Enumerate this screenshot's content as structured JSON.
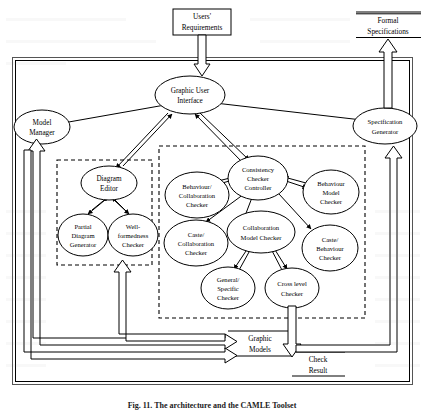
{
  "figure": {
    "caption": "Fig. 11. The architecture and the CAMLE Toolset",
    "title": "The architecture and the CAMLE Toolset"
  },
  "external": {
    "input_box": {
      "name": "users-requirements",
      "lines": [
        "Users'",
        "Requirements"
      ]
    },
    "output_box": {
      "name": "formal-specifications",
      "lines": [
        "Formal",
        "Specifications"
      ]
    }
  },
  "nodes": [
    {
      "id": "gui",
      "lines": [
        "Graphic User",
        "Interface"
      ]
    },
    {
      "id": "model_manager",
      "lines": [
        "Model",
        "Manager"
      ]
    },
    {
      "id": "specification_generator",
      "lines": [
        "Specification",
        "Generator"
      ]
    },
    {
      "id": "diagram_editor",
      "lines": [
        "Diagram",
        "Editor"
      ]
    },
    {
      "id": "partial_diagram_generator",
      "lines": [
        "Partial",
        "Diagram",
        "Generator"
      ]
    },
    {
      "id": "well_formedness_checker",
      "lines": [
        "Well-",
        "formedness",
        "Checker"
      ]
    },
    {
      "id": "behaviour_collaboration_checker",
      "lines": [
        "Behaviour/",
        "Collaboration",
        "Checker"
      ]
    },
    {
      "id": "consistency_checker_controller",
      "lines": [
        "Consistency",
        "Checker",
        "Controller"
      ]
    },
    {
      "id": "behaviour_model_checker",
      "lines": [
        "Behaviour",
        "Model",
        "Checker"
      ]
    },
    {
      "id": "caste_collaboration_checker",
      "lines": [
        "Caste/",
        "Collaboration",
        "Checker"
      ]
    },
    {
      "id": "collaboration_model_checker",
      "lines": [
        "Collaboration",
        "Model Checker"
      ]
    },
    {
      "id": "caste_behaviour_checker",
      "lines": [
        "Caste/",
        "Behaviour",
        "Checker"
      ]
    },
    {
      "id": "general_specific_checker",
      "lines": [
        "General/",
        "Specific",
        "Checker"
      ]
    },
    {
      "id": "cross_level_checker",
      "lines": [
        "Cross level",
        "Checker"
      ]
    }
  ],
  "data_stores": [
    {
      "id": "graphic_models",
      "lines": [
        "Graphic",
        "Models"
      ]
    },
    {
      "id": "check_result",
      "lines": [
        "Check",
        "Result"
      ]
    }
  ],
  "groups": [
    {
      "id": "editor-group",
      "label": ""
    },
    {
      "id": "checker-group",
      "label": ""
    }
  ],
  "colors": {
    "stroke": "#000000",
    "fill": "#ffffff",
    "frame": "#555555",
    "paper": "#ffffff"
  }
}
